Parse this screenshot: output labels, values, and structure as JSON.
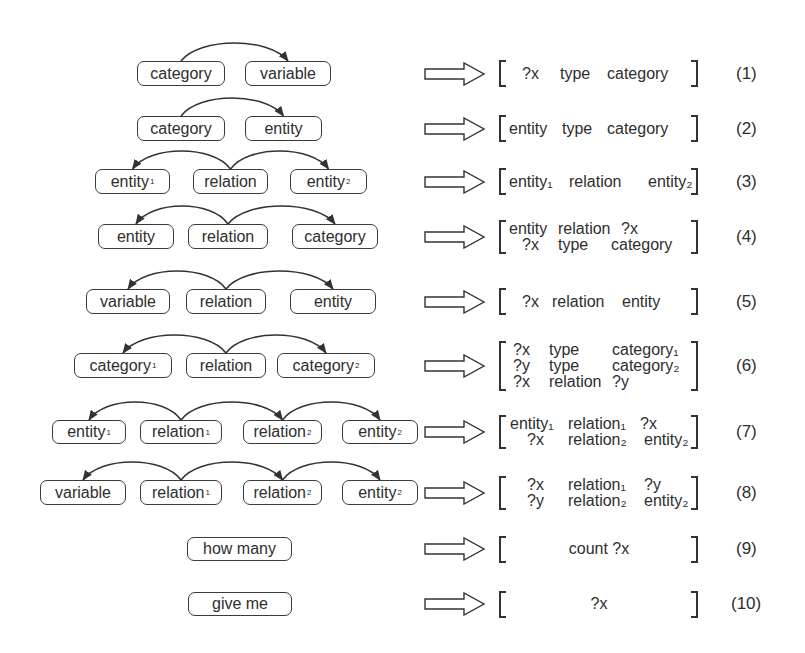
{
  "diagram": {
    "rows": [
      {
        "id": 1,
        "y": 61,
        "h": 25,
        "nodes": [
          {
            "text": "category",
            "x": 137,
            "w": 88
          },
          {
            "text": "variable",
            "x": 245,
            "w": 86
          }
        ],
        "arcs": [
          {
            "from": 0,
            "to": 1
          }
        ],
        "template": {
          "lines": [
            [
              "?x",
              "type",
              "category"
            ]
          ],
          "align": "center"
        },
        "label": "(1)"
      },
      {
        "id": 2,
        "y": 116,
        "h": 25,
        "nodes": [
          {
            "text": "category",
            "x": 137,
            "w": 88
          },
          {
            "text": "entity",
            "x": 245,
            "w": 77
          }
        ],
        "arcs": [
          {
            "from": 0,
            "to": 1
          }
        ],
        "template": {
          "lines": [
            [
              "entity",
              "type",
              "category"
            ]
          ],
          "align": "left"
        },
        "label": "(2)"
      },
      {
        "id": 3,
        "y": 169,
        "h": 25,
        "nodes": [
          {
            "text": "entity",
            "sub": "1",
            "x": 95,
            "w": 75
          },
          {
            "text": "relation",
            "x": 193,
            "w": 75
          },
          {
            "text": "entity",
            "sub": "2",
            "x": 290,
            "w": 77
          }
        ],
        "arcs": [
          {
            "from": 1,
            "to": 0
          },
          {
            "from": 1,
            "to": 2
          }
        ],
        "template": {
          "lines": [
            [
              "entity₁",
              "relation",
              "entity₂"
            ]
          ],
          "align": "left"
        },
        "label": "(3)"
      },
      {
        "id": 4,
        "y": 224,
        "h": 25,
        "nodes": [
          {
            "text": "entity",
            "x": 98,
            "w": 76
          },
          {
            "text": "relation",
            "x": 188,
            "w": 80
          },
          {
            "text": "category",
            "x": 292,
            "w": 86
          }
        ],
        "arcs": [
          {
            "from": 1,
            "to": 0
          },
          {
            "from": 1,
            "to": 2
          }
        ],
        "template": {
          "lines": [
            [
              "entity",
              "relation",
              "?x"
            ],
            [
              "?x",
              "type",
              "category"
            ]
          ],
          "align": "left"
        },
        "label": "(4)"
      },
      {
        "id": 5,
        "y": 289,
        "h": 25,
        "nodes": [
          {
            "text": "variable",
            "x": 86,
            "w": 84
          },
          {
            "text": "relation",
            "x": 186,
            "w": 80
          },
          {
            "text": "entity",
            "x": 290,
            "w": 86
          }
        ],
        "arcs": [
          {
            "from": 1,
            "to": 0
          },
          {
            "from": 1,
            "to": 2
          }
        ],
        "template": {
          "lines": [
            [
              "?x",
              "relation",
              "entity"
            ]
          ],
          "align": "center"
        },
        "label": "(5)"
      },
      {
        "id": 6,
        "y": 353,
        "h": 25,
        "nodes": [
          {
            "text": "category",
            "sub": "1",
            "x": 74,
            "w": 98
          },
          {
            "text": "relation",
            "x": 186,
            "w": 80
          },
          {
            "text": "category",
            "sub": "2",
            "x": 277,
            "w": 98
          }
        ],
        "arcs": [
          {
            "from": 1,
            "to": 0
          },
          {
            "from": 1,
            "to": 2
          }
        ],
        "template": {
          "lines": [
            [
              "?x",
              "type",
              "category₁"
            ],
            [
              "?y",
              "type",
              "category₂"
            ],
            [
              "?x",
              "relation",
              "?y"
            ]
          ],
          "align": "left"
        },
        "label": "(6)"
      },
      {
        "id": 7,
        "y": 420,
        "h": 24,
        "nodes": [
          {
            "text": "entity",
            "sub": "1",
            "x": 52,
            "w": 74
          },
          {
            "text": "relation",
            "sub": "1",
            "x": 140,
            "w": 82
          },
          {
            "text": "relation",
            "sub": "2",
            "x": 243,
            "w": 79
          },
          {
            "text": "entity",
            "sub": "2",
            "x": 342,
            "w": 76
          }
        ],
        "arcs": [
          {
            "from": 1,
            "to": 0
          },
          {
            "from": 1,
            "to": 2
          },
          {
            "from": 2,
            "to": 3
          }
        ],
        "template": {
          "lines": [
            [
              "entity₁",
              "relation₁",
              "?x"
            ],
            [
              "?x",
              "relation₂",
              "entity₂"
            ]
          ],
          "align": "left"
        },
        "label": "(7)"
      },
      {
        "id": 8,
        "y": 480,
        "h": 25,
        "nodes": [
          {
            "text": "variable",
            "x": 40,
            "w": 86
          },
          {
            "text": "relation",
            "sub": "1",
            "x": 140,
            "w": 82
          },
          {
            "text": "relation",
            "sub": "2",
            "x": 243,
            "w": 79
          },
          {
            "text": "entity",
            "sub": "2",
            "x": 342,
            "w": 76
          }
        ],
        "arcs": [
          {
            "from": 1,
            "to": 0
          },
          {
            "from": 1,
            "to": 2
          },
          {
            "from": 2,
            "to": 3
          }
        ],
        "template": {
          "lines": [
            [
              "?x",
              "relation₁",
              "?y"
            ],
            [
              "?y",
              "relation₂",
              "entity₂"
            ]
          ],
          "align": "left"
        },
        "label": "(8)"
      },
      {
        "id": 9,
        "y": 537,
        "h": 24,
        "nodes": [
          {
            "text": "how many",
            "x": 187,
            "w": 105
          }
        ],
        "arcs": [],
        "template": {
          "lines": [
            [
              "count ?x"
            ]
          ],
          "align": "center"
        },
        "label": "(9)"
      },
      {
        "id": 10,
        "y": 592,
        "h": 24,
        "nodes": [
          {
            "text": "give me",
            "x": 188,
            "w": 104
          }
        ],
        "arcs": [],
        "template": {
          "lines": [
            [
              "?x"
            ]
          ],
          "align": "center"
        },
        "label": "(10)"
      }
    ],
    "colors": {
      "stroke": "#333333",
      "text": "#2e2e2e",
      "background": "#ffffff"
    }
  }
}
